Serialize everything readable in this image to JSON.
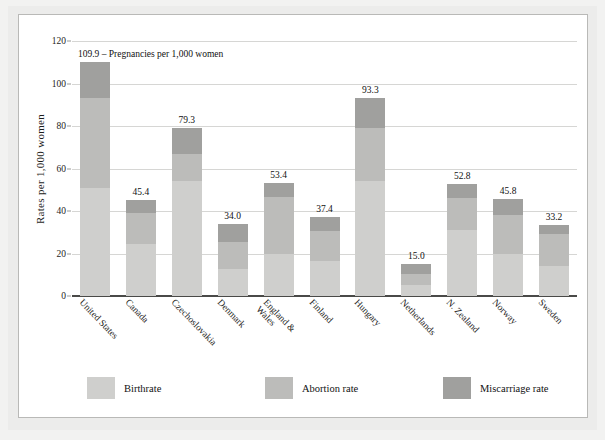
{
  "chart_data": {
    "type": "bar",
    "subtype": "stacked-bar",
    "title": "",
    "annotation": "109.9 – Pregnancies per 1,000 women",
    "xlabel": "",
    "ylabel": "Rates  per 1,000 women",
    "ylim": [
      0,
      120
    ],
    "yticks": [
      0,
      20,
      40,
      60,
      80,
      100,
      120
    ],
    "grid": true,
    "legend_position": "bottom",
    "categories": [
      "United States",
      "Canada",
      "Czechoslovakia",
      "Denmark",
      "England &\nWales",
      "Finland",
      "Hungary",
      "Netherlands",
      "N. Zealand",
      "Norway",
      "Sweden"
    ],
    "series": [
      {
        "name": "Birthrate",
        "color": "#cfcfcd",
        "values": [
          51.0,
          24.5,
          54.0,
          12.5,
          20.0,
          16.5,
          54.0,
          5.0,
          31.0,
          20.0,
          14.0
        ]
      },
      {
        "name": "Abortion rate",
        "color": "#bcbcba",
        "values": [
          42.0,
          14.5,
          13.0,
          13.0,
          26.4,
          14.0,
          25.0,
          5.5,
          15.0,
          18.0,
          15.0
        ]
      },
      {
        "name": "Miscarriage rate",
        "color": "#a0a09e",
        "values": [
          16.9,
          6.4,
          12.3,
          8.5,
          7.0,
          6.9,
          14.3,
          4.5,
          6.8,
          7.8,
          4.2
        ]
      }
    ],
    "totals": [
      109.9,
      45.4,
      79.3,
      34.0,
      53.4,
      37.4,
      93.3,
      15.0,
      52.8,
      45.8,
      33.2
    ],
    "total_labels": [
      "109.9",
      "45.4",
      "79.3",
      "34.0",
      "53.4",
      "37.4",
      "93.3",
      "15.0",
      "52.8",
      "45.8",
      "33.2"
    ]
  },
  "legend": {
    "items": [
      {
        "label": "Birthrate",
        "color": "#cfcfcd"
      },
      {
        "label": "Abortion rate",
        "color": "#bcbcba"
      },
      {
        "label": "Miscarriage rate",
        "color": "#a0a09e"
      }
    ]
  }
}
